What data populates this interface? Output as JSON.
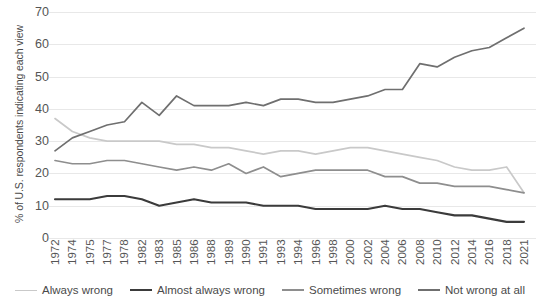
{
  "chart_data": {
    "type": "line",
    "title": "",
    "xlabel": "",
    "ylabel": "% of U.S. respondents indicating each view",
    "ylim": [
      0,
      70
    ],
    "yticks": [
      0,
      10,
      20,
      30,
      40,
      50,
      60,
      70
    ],
    "grid": true,
    "legend_position": "bottom",
    "categories": [
      "1972",
      "1974",
      "1975",
      "1977",
      "1978",
      "1982",
      "1983",
      "1985",
      "1986",
      "1988",
      "1989",
      "1990",
      "1991",
      "1993",
      "1994",
      "1996",
      "1998",
      "2000",
      "2002",
      "2004",
      "2006",
      "2008",
      "2010",
      "2012",
      "2014",
      "2016",
      "2018",
      "2021"
    ],
    "series": [
      {
        "name": "Always wrong",
        "color": "#c9c9c9",
        "values": [
          37,
          33,
          31,
          30,
          30,
          30,
          30,
          29,
          29,
          28,
          28,
          27,
          26,
          27,
          27,
          26,
          27,
          28,
          28,
          27,
          26,
          25,
          24,
          22,
          21,
          21,
          22,
          14
        ]
      },
      {
        "name": "Almost always wrong",
        "color": "#3b3b3b",
        "values": [
          12,
          12,
          12,
          13,
          13,
          12,
          10,
          11,
          12,
          11,
          11,
          11,
          10,
          10,
          10,
          9,
          9,
          9,
          9,
          10,
          9,
          9,
          8,
          7,
          7,
          6,
          5,
          5
        ]
      },
      {
        "name": "Sometimes wrong",
        "color": "#8e8e8e",
        "values": [
          24,
          23,
          23,
          24,
          24,
          23,
          22,
          21,
          22,
          21,
          23,
          20,
          22,
          19,
          20,
          21,
          21,
          21,
          21,
          19,
          19,
          17,
          17,
          16,
          16,
          16,
          15,
          14
        ]
      },
      {
        "name": "Not wrong at all",
        "color": "#6f6f6f",
        "values": [
          27,
          31,
          33,
          35,
          36,
          42,
          38,
          44,
          41,
          41,
          41,
          42,
          41,
          43,
          43,
          42,
          42,
          43,
          44,
          46,
          46,
          54,
          53,
          56,
          58,
          59,
          62,
          65
        ]
      }
    ]
  },
  "legend": {
    "items": [
      {
        "label": "Always wrong",
        "color": "#c9c9c9",
        "width": 1.8
      },
      {
        "label": "Almost always wrong",
        "color": "#3b3b3b",
        "width": 2.6
      },
      {
        "label": "Sometimes wrong",
        "color": "#8e8e8e",
        "width": 2.2
      },
      {
        "label": "Not wrong at all",
        "color": "#6f6f6f",
        "width": 2.2
      }
    ]
  }
}
